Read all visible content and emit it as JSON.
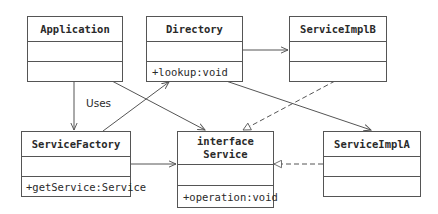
{
  "diagram": {
    "type": "UML class diagram",
    "classes": [
      {
        "id": "application",
        "name": "Application",
        "stereotype": "",
        "attributes": "",
        "operations": ""
      },
      {
        "id": "directory",
        "name": "Directory",
        "stereotype": "",
        "attributes": "",
        "operations": "+lookup:void"
      },
      {
        "id": "serviceimplb",
        "name": "ServiceImplB",
        "stereotype": "",
        "attributes": "",
        "operations": ""
      },
      {
        "id": "servicefactory",
        "name": "ServiceFactory",
        "stereotype": "",
        "attributes": "",
        "operations": "+getService:Service"
      },
      {
        "id": "service",
        "name": "Service",
        "stereotype": "interface",
        "attributes": "",
        "operations": "+operation:void"
      },
      {
        "id": "serviceimpla",
        "name": "ServiceImplA",
        "stereotype": "",
        "attributes": "",
        "operations": ""
      }
    ],
    "relationships": [
      {
        "from": "Application",
        "to": "ServiceFactory",
        "kind": "association",
        "label": "Uses"
      },
      {
        "from": "Application",
        "to": "Service",
        "kind": "association",
        "label": ""
      },
      {
        "from": "ServiceFactory",
        "to": "Directory",
        "kind": "association",
        "label": ""
      },
      {
        "from": "ServiceFactory",
        "to": "Service",
        "kind": "association",
        "label": ""
      },
      {
        "from": "Directory",
        "to": "ServiceImplB",
        "kind": "association",
        "label": ""
      },
      {
        "from": "Directory",
        "to": "ServiceImplA",
        "kind": "association",
        "label": ""
      },
      {
        "from": "ServiceImplB",
        "to": "Service",
        "kind": "realization",
        "label": ""
      },
      {
        "from": "ServiceImplA",
        "to": "Service",
        "kind": "realization",
        "label": ""
      }
    ],
    "labels": {
      "uses": "Uses"
    },
    "colors": {
      "line": "#555555",
      "text": "#2a2a2a",
      "background": "#ffffff"
    }
  }
}
